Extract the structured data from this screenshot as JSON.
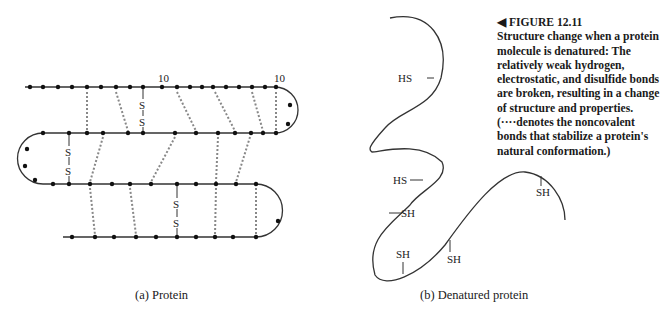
{
  "figure": {
    "marker": "◀",
    "number": "FIGURE 12.11",
    "caption": "Structure change when a protein molecule is denatured: The relatively weak hydrogen, electrostatic, and disulfide bonds are broken, resulting in a change of structure and properties. (····denotes the noncovalent bonds that stabilize a protein's natural conformation.)"
  },
  "panel_a": {
    "caption": "(a)  Protein",
    "labels": {
      "ten_1": "10",
      "ten_2": "10",
      "s": "S"
    }
  },
  "panel_b": {
    "caption": "(b)  Denatured protein",
    "labels": {
      "hs": "HS",
      "sh": "SH"
    }
  }
}
